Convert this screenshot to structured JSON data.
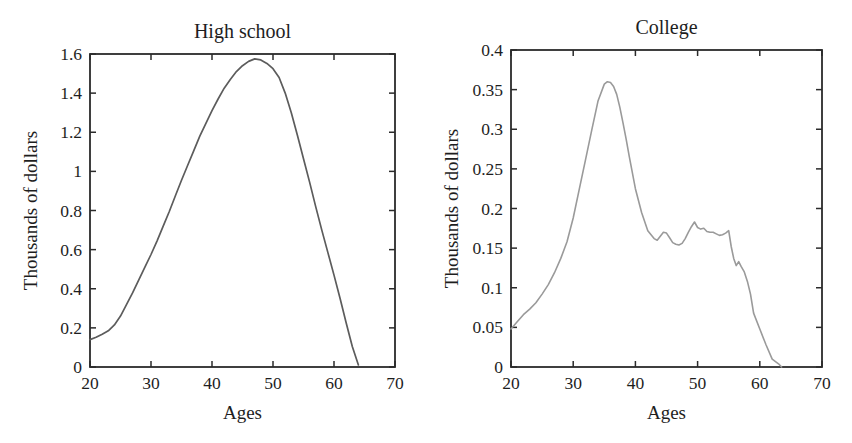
{
  "figure": {
    "background": "#ffffff",
    "text_color": "#1e1e1e",
    "axis_color": "#2b2b2b"
  },
  "chart_data": [
    {
      "type": "line",
      "title": "High school",
      "xlabel": "Ages",
      "ylabel": "Thousands of dollars",
      "xlim": [
        20,
        70
      ],
      "ylim": [
        0,
        1.6
      ],
      "xticks": [
        20,
        30,
        40,
        50,
        60,
        70
      ],
      "xtick_labels": [
        "20",
        "30",
        "40",
        "50",
        "60",
        "70"
      ],
      "yticks": [
        0,
        0.2,
        0.4,
        0.6,
        0.8,
        1,
        1.2,
        1.4,
        1.6
      ],
      "ytick_labels": [
        "0",
        "0.2",
        "0.4",
        "0.6",
        "0.8",
        "1",
        "1.2",
        "1.4",
        "1.6"
      ],
      "grid": false,
      "legend": "none",
      "line_color": "#5c5c5c",
      "line_width": 1.7,
      "series": [
        {
          "name": "High school",
          "x": [
            20,
            21,
            22,
            23,
            24,
            25,
            26,
            27,
            28,
            29,
            30,
            31,
            32,
            33,
            34,
            35,
            36,
            37,
            38,
            39,
            40,
            41,
            42,
            43,
            44,
            45,
            46,
            47,
            48,
            49,
            50,
            51,
            52,
            53,
            54,
            55,
            56,
            57,
            58,
            59,
            60,
            61,
            62,
            63,
            64
          ],
          "y": [
            0.14,
            0.152,
            0.167,
            0.185,
            0.215,
            0.26,
            0.32,
            0.38,
            0.445,
            0.51,
            0.575,
            0.645,
            0.72,
            0.795,
            0.875,
            0.955,
            1.03,
            1.105,
            1.18,
            1.245,
            1.31,
            1.37,
            1.425,
            1.47,
            1.51,
            1.54,
            1.562,
            1.575,
            1.57,
            1.552,
            1.525,
            1.48,
            1.4,
            1.3,
            1.185,
            1.065,
            0.945,
            0.82,
            0.7,
            0.585,
            0.47,
            0.35,
            0.225,
            0.105,
            0.01
          ]
        }
      ]
    },
    {
      "type": "line",
      "title": "College",
      "xlabel": "Ages",
      "ylabel": "Thousands of dollars",
      "xlim": [
        20,
        70
      ],
      "ylim": [
        0,
        0.4
      ],
      "xticks": [
        20,
        30,
        40,
        50,
        60,
        70
      ],
      "xtick_labels": [
        "20",
        "30",
        "40",
        "50",
        "60",
        "70"
      ],
      "yticks": [
        0,
        0.05,
        0.1,
        0.15,
        0.2,
        0.25,
        0.3,
        0.35,
        0.4
      ],
      "ytick_labels": [
        "0",
        "0.05",
        "0.1",
        "0.15",
        "0.2",
        "0.25",
        "0.3",
        "0.35",
        "0.4"
      ],
      "grid": false,
      "legend": "none",
      "line_color": "#9a9a9a",
      "line_width": 1.6,
      "series": [
        {
          "name": "College",
          "x": [
            20,
            21,
            22,
            23,
            24,
            25,
            26,
            27,
            28,
            29,
            30,
            31,
            32,
            33,
            34,
            35,
            35.5,
            36,
            36.5,
            37,
            37.5,
            38,
            38.5,
            39,
            40,
            41,
            42,
            43,
            43.5,
            44,
            44.5,
            45,
            45.5,
            46,
            46.5,
            47,
            47.5,
            48,
            48.5,
            49,
            49.5,
            50,
            50.5,
            51,
            51.5,
            52,
            52.5,
            53,
            53.5,
            54,
            54.5,
            55,
            55.4,
            55.8,
            56.2,
            56.6,
            57,
            57.5,
            58,
            58.5,
            59,
            60,
            61,
            62,
            63,
            63.5,
            64
          ],
          "y": [
            0.048,
            0.057,
            0.066,
            0.073,
            0.081,
            0.092,
            0.104,
            0.119,
            0.137,
            0.158,
            0.188,
            0.225,
            0.262,
            0.3,
            0.336,
            0.357,
            0.36,
            0.359,
            0.354,
            0.344,
            0.328,
            0.308,
            0.288,
            0.266,
            0.225,
            0.195,
            0.172,
            0.162,
            0.16,
            0.165,
            0.17,
            0.169,
            0.163,
            0.157,
            0.155,
            0.154,
            0.156,
            0.162,
            0.17,
            0.177,
            0.183,
            0.176,
            0.174,
            0.175,
            0.171,
            0.17,
            0.17,
            0.168,
            0.166,
            0.167,
            0.169,
            0.172,
            0.152,
            0.137,
            0.128,
            0.133,
            0.127,
            0.12,
            0.108,
            0.092,
            0.068,
            0.048,
            0.028,
            0.01,
            0.004,
            0.0
          ]
        }
      ]
    }
  ]
}
